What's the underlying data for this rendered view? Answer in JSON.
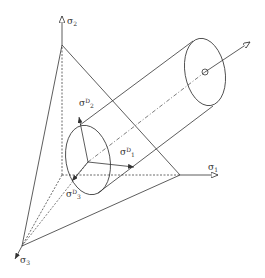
{
  "diagram": {
    "axes": {
      "sigma1": {
        "symbol": "σ",
        "index": "1"
      },
      "sigma2": {
        "symbol": "σ",
        "index": "2"
      },
      "sigma3": {
        "symbol": "σ",
        "index": "3"
      }
    },
    "deviatoric": {
      "sigma_d1": {
        "symbol": "σ",
        "sup": "D",
        "index": "1"
      },
      "sigma_d2": {
        "symbol": "σ",
        "sup": "D",
        "index": "2"
      },
      "sigma_d3": {
        "symbol": "σ",
        "sup": "D",
        "index": "3"
      }
    },
    "colors": {
      "line": "#333333",
      "background": "#ffffff"
    }
  }
}
